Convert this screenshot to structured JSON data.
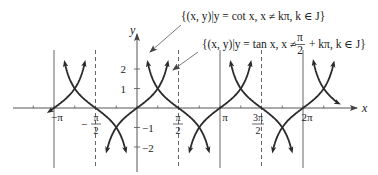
{
  "figure": {
    "type": "function-graph",
    "functions": [
      {
        "name": "cot",
        "label_set": "{(x, y)|y = cot x, x ≠ kπ, k ∈ J}",
        "asymptotes": "x = kπ (solid lines)"
      },
      {
        "name": "tan",
        "label_set_prefix": "{(x, y)|y = tan x, x ≠ ",
        "label_set_frac_num": "π",
        "label_set_frac_den": "2",
        "label_set_suffix": " + kπ, k ∈ J}",
        "asymptotes": "x = π/2 + kπ (dashed lines)"
      }
    ],
    "axes": {
      "x_label": "x",
      "y_label": "y",
      "x_ticks": [
        {
          "label": "−π",
          "value": -3.14159
        },
        {
          "label_num": "π",
          "label_den": "2",
          "label_sign": "−",
          "value": -1.5708
        },
        {
          "label_num": "π",
          "label_den": "2",
          "label_sign": "",
          "value": 1.5708
        },
        {
          "label": "π",
          "value": 3.14159
        },
        {
          "label_num": "3π",
          "label_den": "2",
          "label_sign": "",
          "value": 4.7124
        },
        {
          "label": "2π",
          "value": 6.28319
        }
      ],
      "y_ticks": [
        {
          "label": "2",
          "value": 2
        },
        {
          "label": "1",
          "value": 1
        },
        {
          "label": "−1",
          "value": -1
        },
        {
          "label": "−2",
          "value": -2
        }
      ],
      "x_range": [
        -3.3,
        7.6
      ],
      "y_range": [
        -2.4,
        3.5
      ]
    },
    "colors": {
      "curve": "#2b2b2b",
      "axis": "#555555",
      "asymptote": "#666666",
      "text": "#222222"
    }
  },
  "labels": {
    "cot_set": "{(x, y)|y = cot x, x ≠ kπ, k ∈ J}",
    "tan_set_prefix": "{(x, y)|y = tan x, x ≠",
    "tan_set_num": "π",
    "tan_set_den": "2",
    "tan_set_suffix": "+ kπ, k ∈ J}",
    "x_axis": "x",
    "y_axis": "y",
    "tick_neg_pi": "−π",
    "tick_neg_half_sign": "−",
    "tick_neg_half_num": "π",
    "tick_neg_half_den": "2",
    "tick_half_num": "π",
    "tick_half_den": "2",
    "tick_pi": "π",
    "tick_3half_num": "3π",
    "tick_3half_den": "2",
    "tick_2pi": "2π",
    "y_2": "2",
    "y_1": "1",
    "y_m1": "−1",
    "y_m2": "−2"
  }
}
